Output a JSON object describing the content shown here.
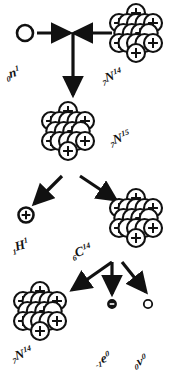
{
  "diagram": {
    "stroke_color": "#111111",
    "fill_color": "#ffffff",
    "background": "#ffffff"
  },
  "labels": {
    "neutron": {
      "pre": "0",
      "el": "n",
      "post": "1",
      "name": "neutron"
    },
    "nitrogen14a": {
      "pre": "7",
      "el": "N",
      "post": "14",
      "name": "nitrogen-14-target"
    },
    "nitrogen15": {
      "pre": "7",
      "el": "N",
      "post": "15",
      "name": "nitrogen-15-compound"
    },
    "hydrogen1": {
      "pre": "1",
      "el": "H",
      "post": "1",
      "name": "proton"
    },
    "carbon14": {
      "pre": "6",
      "el": "C",
      "post": "14",
      "name": "carbon-14"
    },
    "nitrogen14b": {
      "pre": "7",
      "el": "N",
      "post": "14",
      "name": "nitrogen-14-product"
    },
    "electron": {
      "pre": "-1",
      "el": "e",
      "post": "0",
      "name": "beta-electron"
    },
    "neutrino": {
      "pre": "0",
      "el": "v",
      "post": "0",
      "name": "antineutrino"
    }
  },
  "nuclei": {
    "nitrogen14_top": {
      "id": "n14-top",
      "cx": 136,
      "cy": 33,
      "r": 9.0,
      "nucleons": [
        {
          "dx": 0.0,
          "dy": -20.0,
          "charged": true
        },
        {
          "dx": -17.0,
          "dy": -10.0,
          "charged": true
        },
        {
          "dx": -8.5,
          "dy": -10.0,
          "charged": false
        },
        {
          "dx": 0.0,
          "dy": -10.0,
          "charged": false
        },
        {
          "dx": 8.5,
          "dy": -10.0,
          "charged": false
        },
        {
          "dx": 17.0,
          "dy": -10.0,
          "charged": true
        },
        {
          "dx": -12.7,
          "dy": 0.0,
          "charged": false
        },
        {
          "dx": -4.2,
          "dy": 0.0,
          "charged": false
        },
        {
          "dx": 4.2,
          "dy": 0.0,
          "charged": true
        },
        {
          "dx": 12.7,
          "dy": 0.0,
          "charged": false
        },
        {
          "dx": -17.0,
          "dy": 10.0,
          "charged": true
        },
        {
          "dx": -8.5,
          "dy": 10.0,
          "charged": false
        },
        {
          "dx": 0.0,
          "dy": 10.0,
          "charged": false
        },
        {
          "dx": 8.5,
          "dy": 10.0,
          "charged": false
        },
        {
          "dx": 17.0,
          "dy": 10.0,
          "charged": true
        },
        {
          "dx": 0.0,
          "dy": 20.0,
          "charged": true
        }
      ]
    },
    "nitrogen15": {
      "id": "n15",
      "cx": 68,
      "cy": 131,
      "r": 9.0,
      "nucleons": [
        {
          "dx": 0.0,
          "dy": -20.0,
          "charged": true
        },
        {
          "dx": -17.0,
          "dy": -10.0,
          "charged": true
        },
        {
          "dx": -8.5,
          "dy": -10.0,
          "charged": false
        },
        {
          "dx": 0.0,
          "dy": -10.0,
          "charged": false
        },
        {
          "dx": 8.5,
          "dy": -10.0,
          "charged": false
        },
        {
          "dx": 17.0,
          "dy": -10.0,
          "charged": true
        },
        {
          "dx": -12.7,
          "dy": 0.0,
          "charged": false
        },
        {
          "dx": -4.2,
          "dy": 0.0,
          "charged": false
        },
        {
          "dx": 4.2,
          "dy": 0.0,
          "charged": true
        },
        {
          "dx": 12.7,
          "dy": 0.0,
          "charged": false
        },
        {
          "dx": -17.0,
          "dy": 10.0,
          "charged": true
        },
        {
          "dx": -8.5,
          "dy": 10.0,
          "charged": false
        },
        {
          "dx": 0.0,
          "dy": 10.0,
          "charged": false
        },
        {
          "dx": 8.5,
          "dy": 10.0,
          "charged": false
        },
        {
          "dx": 17.0,
          "dy": 10.0,
          "charged": true
        },
        {
          "dx": 0.0,
          "dy": 20.0,
          "charged": true
        }
      ]
    },
    "carbon14": {
      "id": "c14",
      "cx": 136,
      "cy": 218,
      "r": 9.0,
      "nucleons": [
        {
          "dx": 0.0,
          "dy": -20.0,
          "charged": true
        },
        {
          "dx": -17.0,
          "dy": -10.0,
          "charged": true
        },
        {
          "dx": -8.5,
          "dy": -10.0,
          "charged": false
        },
        {
          "dx": 0.0,
          "dy": -10.0,
          "charged": false
        },
        {
          "dx": 8.5,
          "dy": -10.0,
          "charged": false
        },
        {
          "dx": 17.0,
          "dy": -10.0,
          "charged": true
        },
        {
          "dx": -12.7,
          "dy": 0.0,
          "charged": false
        },
        {
          "dx": -4.2,
          "dy": 0.0,
          "charged": false
        },
        {
          "dx": 4.2,
          "dy": 0.0,
          "charged": true
        },
        {
          "dx": 12.7,
          "dy": 0.0,
          "charged": false
        },
        {
          "dx": -17.0,
          "dy": 10.0,
          "charged": true
        },
        {
          "dx": -8.5,
          "dy": 10.0,
          "charged": false
        },
        {
          "dx": 0.0,
          "dy": 10.0,
          "charged": false
        },
        {
          "dx": 8.5,
          "dy": 10.0,
          "charged": false
        },
        {
          "dx": 17.0,
          "dy": 10.0,
          "charged": true
        },
        {
          "dx": 0.0,
          "dy": 20.0,
          "charged": true
        }
      ]
    },
    "nitrogen14_bottom": {
      "id": "n14-bot",
      "cx": 40,
      "cy": 311,
      "r": 9.0,
      "nucleons": [
        {
          "dx": 0.0,
          "dy": -20.0,
          "charged": true
        },
        {
          "dx": -17.0,
          "dy": -10.0,
          "charged": true
        },
        {
          "dx": -8.5,
          "dy": -10.0,
          "charged": false
        },
        {
          "dx": 0.0,
          "dy": -10.0,
          "charged": false
        },
        {
          "dx": 8.5,
          "dy": -10.0,
          "charged": false
        },
        {
          "dx": 17.0,
          "dy": -10.0,
          "charged": true
        },
        {
          "dx": -12.7,
          "dy": 0.0,
          "charged": false
        },
        {
          "dx": -4.2,
          "dy": 0.0,
          "charged": false
        },
        {
          "dx": 4.2,
          "dy": 0.0,
          "charged": true
        },
        {
          "dx": 12.7,
          "dy": 0.0,
          "charged": false
        },
        {
          "dx": -17.0,
          "dy": 10.0,
          "charged": true
        },
        {
          "dx": -8.5,
          "dy": 10.0,
          "charged": false
        },
        {
          "dx": 0.0,
          "dy": 10.0,
          "charged": false
        },
        {
          "dx": 8.5,
          "dy": 10.0,
          "charged": false
        },
        {
          "dx": 17.0,
          "dy": 10.0,
          "charged": true
        },
        {
          "dx": 0.0,
          "dy": 20.0,
          "charged": true
        }
      ]
    }
  },
  "particles": {
    "neutron": {
      "cx": 25,
      "cy": 33,
      "r": 8.0,
      "style": "open"
    },
    "proton": {
      "cx": 26,
      "cy": 215,
      "r": 7.5,
      "style": "plus"
    },
    "electron": {
      "cx": 112,
      "cy": 304,
      "r": 4.2,
      "style": "minus-filled"
    },
    "neutrino": {
      "cx": 148,
      "cy": 304,
      "r": 4.2,
      "style": "open-small"
    }
  },
  "arrows": {
    "neutron_in": {
      "x1": 37,
      "y1": 33,
      "x2": 70,
      "y2": 33
    },
    "nitrogen_in": {
      "x1": 112,
      "y1": 33,
      "x2": 74,
      "y2": 33
    },
    "junction_down": {
      "x1": 73,
      "y1": 33,
      "x2": 73,
      "y2": 95
    },
    "n15_to_proton": {
      "x1": 62,
      "y1": 176,
      "x2": 34,
      "y2": 204
    },
    "n15_to_carbon": {
      "x1": 80,
      "y1": 176,
      "x2": 116,
      "y2": 200
    },
    "c14_to_n14": {
      "x1": 112,
      "y1": 262,
      "x2": 72,
      "y2": 290
    },
    "c14_to_electron": {
      "x1": 112,
      "y1": 262,
      "x2": 112,
      "y2": 294
    },
    "c14_to_neutrino": {
      "x1": 122,
      "y1": 262,
      "x2": 146,
      "y2": 292
    }
  }
}
